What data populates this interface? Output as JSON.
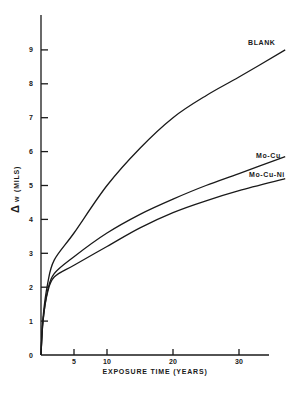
{
  "chart_data": {
    "type": "line",
    "title": "",
    "xlabel": "EXPOSURE TIME (YEARS)",
    "ylabel_symbol": "Δ",
    "ylabel_var": "w",
    "ylabel_unit": "(MILS)",
    "xlim": [
      0,
      34.5
    ],
    "ylim": [
      0,
      10
    ],
    "x_ticks": [
      5,
      10,
      20,
      30
    ],
    "x_tick_labels": [
      "5",
      "10",
      "20",
      "30"
    ],
    "y_ticks": [
      0,
      1,
      2,
      3,
      4,
      5,
      6,
      7,
      8,
      9
    ],
    "y_tick_labels": [
      "0",
      "1",
      "2",
      "3",
      "4",
      "5",
      "6",
      "7",
      "8",
      "9"
    ],
    "grid": false,
    "legend": "inline labels at curve ends",
    "series": [
      {
        "name": "BLANK",
        "x": [
          0,
          0.3,
          1,
          2,
          5,
          10,
          15,
          20,
          25,
          30,
          37
        ],
        "y": [
          0,
          1.1,
          2.1,
          2.8,
          3.6,
          5.0,
          6.1,
          7.0,
          7.65,
          8.2,
          9.0
        ]
      },
      {
        "name": "Mo-Cu",
        "x": [
          0,
          0.3,
          1,
          2,
          5,
          10,
          15,
          20,
          25,
          30,
          37
        ],
        "y": [
          0,
          1.0,
          1.9,
          2.4,
          2.9,
          3.6,
          4.15,
          4.6,
          5.0,
          5.35,
          5.85
        ]
      },
      {
        "name": "Mo-Cu-Ni",
        "x": [
          0,
          0.3,
          1,
          2,
          5,
          10,
          15,
          20,
          25,
          30,
          37
        ],
        "y": [
          0,
          1.0,
          1.85,
          2.3,
          2.65,
          3.2,
          3.75,
          4.2,
          4.55,
          4.85,
          5.2
        ]
      }
    ]
  }
}
